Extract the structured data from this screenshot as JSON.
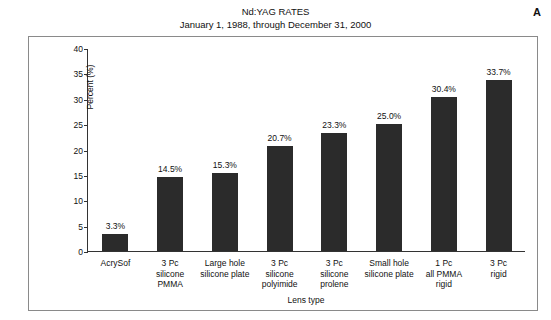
{
  "panel": {
    "letter": "A"
  },
  "chart_data": {
    "type": "bar",
    "title": "Nd:YAG RATES",
    "subtitle": "January 1, 1988, through December 31, 2000",
    "xlabel": "Lens type",
    "ylabel": "Percent (%)",
    "ylim": [
      0,
      40
    ],
    "yticks": [
      0,
      5,
      10,
      15,
      20,
      25,
      30,
      35,
      40
    ],
    "ytick_labels": [
      "0",
      "5",
      "10",
      "15",
      "20",
      "25",
      "30",
      "35",
      "40"
    ],
    "grid": false,
    "legend": "none",
    "bar_color": "#2b2b2b",
    "categories": [
      "AcrySof",
      "3 Pc\nsilicone\nPMMA",
      "Large hole\nsilicone plate",
      "3 Pc\nsilicone\npolyimide",
      "3 Pc\nsilicone\nprolene",
      "Small hole\nsilicone plate",
      "1 Pc\nall PMMA\nrigid",
      "3 Pc\nrigid"
    ],
    "values": [
      3.3,
      14.5,
      15.3,
      20.7,
      23.3,
      25.0,
      30.4,
      33.7
    ],
    "value_labels": [
      "3.3%",
      "14.5%",
      "15.3%",
      "20.7%",
      "23.3%",
      "25.0%",
      "30.4%",
      "33.7%"
    ]
  }
}
